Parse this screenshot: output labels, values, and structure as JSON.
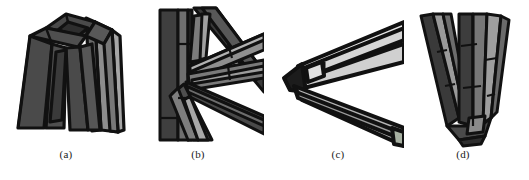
{
  "figure": {
    "background": "#ffffff",
    "outline_color": "#111111",
    "panel_count": 4,
    "caption_font_size_px": 11,
    "palette": {
      "very_dark": "#2b2b2b",
      "dark": "#3a3a3a",
      "mid_dark": "#4a4a4a",
      "mid": "#5d5d5d",
      "mid_light": "#767676",
      "light": "#9a9a9a",
      "lighter": "#b8b8b8",
      "very_light": "#d6d6d6",
      "near_white": "#eaeaea",
      "outline": "#111111",
      "background": "#ffffff"
    }
  },
  "panels": [
    {
      "id": "a",
      "caption": "(a)",
      "subject": "truncated-pyramid-frame",
      "description": "Tapered four-legged prism frame viewed from above, dark grey faces with thick black edges",
      "dominant_shade": "#4a4a4a"
    },
    {
      "id": "b",
      "caption": "(b)",
      "subject": "radial-beam-junction",
      "description": "Several long rectangular beams converging at a single off-center node",
      "dominant_shade": "#5d5d5d"
    },
    {
      "id": "c",
      "caption": "(c)",
      "subject": "acute-beam-vertex",
      "description": "Two light grey beams meeting at a sharp leftward point with a dark wedge cap",
      "dominant_shade": "#d6d6d6"
    },
    {
      "id": "d",
      "caption": "(d)",
      "subject": "v-shaped-prism-joint",
      "description": "V shaped pair of tapered prisms meeting at a base joint",
      "dominant_shade": "#6a6a6a"
    }
  ]
}
